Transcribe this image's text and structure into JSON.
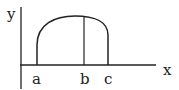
{
  "diagram": {
    "axes": {
      "x_label": "x",
      "y_label": "y"
    },
    "points": [
      {
        "label": "a"
      },
      {
        "label": "b"
      },
      {
        "label": "c"
      }
    ],
    "colors": {
      "stroke": "#222222",
      "background": "#ffffff"
    }
  }
}
